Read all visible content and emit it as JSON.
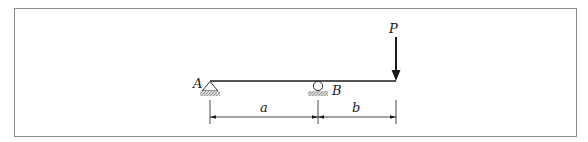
{
  "diagram": {
    "type": "simply-supported beam with overhang",
    "labels": {
      "support_a": "A",
      "support_b": "B",
      "load": "P",
      "dim_a": "a",
      "dim_b": "b"
    },
    "supports": [
      {
        "id": "A",
        "kind": "pin"
      },
      {
        "id": "B",
        "kind": "roller"
      }
    ],
    "load": {
      "id": "P",
      "direction": "down",
      "location": "free end"
    },
    "dimensions": [
      {
        "label": "a",
        "from": "A",
        "to": "B"
      },
      {
        "label": "b",
        "from": "B",
        "to": "free end"
      }
    ],
    "colors": {
      "frame": "#888888",
      "line": "#1a1a1a",
      "hatch": "#999999"
    }
  }
}
